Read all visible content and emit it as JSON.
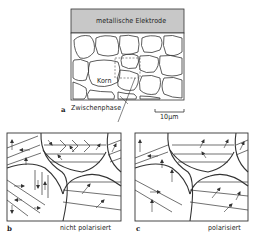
{
  "figure": {
    "panel_a": {
      "letter": "a",
      "electrode_label": "metallische Elektrode",
      "grain_label": "Korn",
      "interphase_label": "Zwischenphase",
      "scale_bar_label": "10µm"
    },
    "panel_b": {
      "letter": "b",
      "caption": "nicht polarisiert"
    },
    "panel_c": {
      "letter": "c",
      "caption": "polarisiert"
    },
    "colors": {
      "line": "#333333",
      "electrode_fill": "#c8c8c8",
      "background": "#ffffff"
    }
  }
}
